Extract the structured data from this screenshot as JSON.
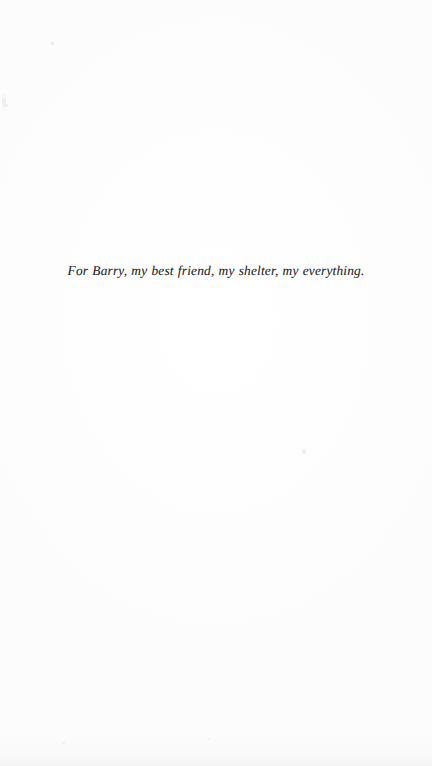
{
  "page": {
    "kind": "book-dedication-page",
    "background_color": "#fffefe",
    "ink_color": "#2a2a2e"
  },
  "dedication": {
    "text": "For Barry, my best friend, my shelter, my everything."
  },
  "artifacts": {
    "speck_a": "scan-speck",
    "speck_b": "scan-speck",
    "speck_c": "scan-speck",
    "speck_d": "scan-speck",
    "speck_e": "scan-speck",
    "edge_smudge": "scan-edge-smudge",
    "bottom_shadow": "scan-bottom-shadow"
  }
}
